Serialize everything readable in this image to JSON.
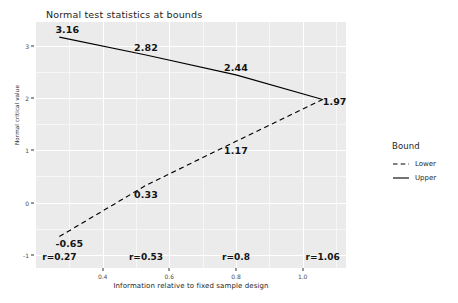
{
  "chart_data": {
    "type": "line",
    "title": "Normal test statistics at bounds",
    "xlabel": "Information relative to fixed sample design",
    "ylabel": "Normal critical value",
    "x": [
      0.27,
      0.53,
      0.8,
      1.06
    ],
    "xlim": [
      0.2,
      1.13
    ],
    "ylim": [
      -1.25,
      3.45
    ],
    "grid": true,
    "legend_position": "right",
    "legend_title": "Bound",
    "x_tick_labels": [
      "0.4",
      "0.6",
      "0.8",
      "1.0"
    ],
    "x_tick_values": [
      0.4,
      0.6,
      0.8,
      1.0
    ],
    "x_minor_tick_values": [
      0.3,
      0.5,
      0.7,
      0.9,
      1.1
    ],
    "y_tick_labels": [
      "-1",
      "0",
      "1",
      "2",
      "3"
    ],
    "y_tick_values": [
      -1,
      0,
      1,
      2,
      3
    ],
    "y_minor_tick_values": [
      -0.5,
      0.5,
      1.5,
      2.5
    ],
    "secondary_x_labels": [
      "r=0.27",
      "r=0.53",
      "r=0.8",
      "r=1.06"
    ],
    "series": [
      {
        "name": "Upper",
        "linestyle": "solid",
        "color": "#000000",
        "values": [
          3.16,
          2.82,
          2.44,
          1.97
        ],
        "point_labels": [
          "3.16",
          "2.82",
          "2.44",
          "1.97"
        ]
      },
      {
        "name": "Lower",
        "linestyle": "dashed",
        "color": "#000000",
        "values": [
          -0.65,
          0.33,
          1.17,
          1.97
        ],
        "point_labels": [
          "-0.65",
          "0.33",
          "1.17",
          "1.97"
        ]
      }
    ]
  },
  "legend": {
    "title": "Bound",
    "items": [
      {
        "label": "Lower",
        "style": "dashed"
      },
      {
        "label": "Upper",
        "style": "solid"
      }
    ]
  },
  "colors": {
    "panel_background": "#ebebeb",
    "grid_major": "#ffffff",
    "grid_minor": "#f7f7f7",
    "line": "#000000",
    "text": "#1a1a1a"
  }
}
